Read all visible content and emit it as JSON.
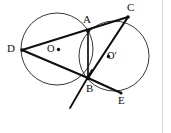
{
  "figure": {
    "type": "geometry-diagram",
    "background_color": "#ffffff",
    "stroke_color": "#100f0f",
    "circle_stroke_color": "#221f1f",
    "page_edge_color": "#d9d9d9"
  },
  "labels": {
    "A": "A",
    "B": "B",
    "C": "C",
    "D": "D",
    "E": "E",
    "O": "O",
    "O_prime": "O′"
  },
  "points": [
    {
      "name": "A",
      "label": "A",
      "x": 88,
      "y": 31
    },
    {
      "name": "B",
      "label": "B",
      "x": 88,
      "y": 78
    },
    {
      "name": "C",
      "label": "C",
      "x": 128,
      "y": 17
    },
    {
      "name": "D",
      "label": "D",
      "x": 22,
      "y": 50
    },
    {
      "name": "E",
      "label": "E",
      "x": 121,
      "y": 93
    },
    {
      "name": "O",
      "label": "O",
      "x": 57,
      "y": 49
    },
    {
      "name": "O_prime",
      "label": "O′",
      "x": 114,
      "y": 56
    }
  ],
  "circles": [
    {
      "name": "circle-O",
      "center_label": "O",
      "cx": 57,
      "cy": 49,
      "r": 36
    },
    {
      "name": "circle-O-prime",
      "center_label": "O′",
      "cx": 114,
      "cy": 56,
      "r": 35
    }
  ],
  "segments": [
    {
      "name": "segment-DC",
      "from": "D",
      "to": "C",
      "through": "A"
    },
    {
      "name": "segment-DB",
      "from": "D",
      "to": "B"
    },
    {
      "name": "segment-AB",
      "from": "A",
      "to": "B"
    },
    {
      "name": "segment-BC",
      "from": "B",
      "to": "C"
    },
    {
      "name": "segment-BE",
      "from": "B",
      "to": "E"
    },
    {
      "name": "tangent-at-B",
      "from": "B",
      "to": "tangent-end"
    }
  ]
}
